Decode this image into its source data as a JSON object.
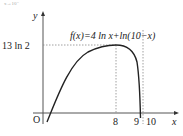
{
  "header_fragment": "x→10⁻",
  "axes": {
    "x_label": "x",
    "y_label": "y",
    "origin_label": "O"
  },
  "function_label": "f(x)=4 ln x+ln(10−x)",
  "y_marks": [
    {
      "label": "13 ln 2",
      "value": "13ln2"
    }
  ],
  "x_marks": [
    {
      "label": "8"
    },
    {
      "label": "9"
    },
    {
      "label": "10"
    }
  ],
  "colors": {
    "axis": "#555555",
    "curve": "#222222",
    "dashed": "#888888"
  }
}
